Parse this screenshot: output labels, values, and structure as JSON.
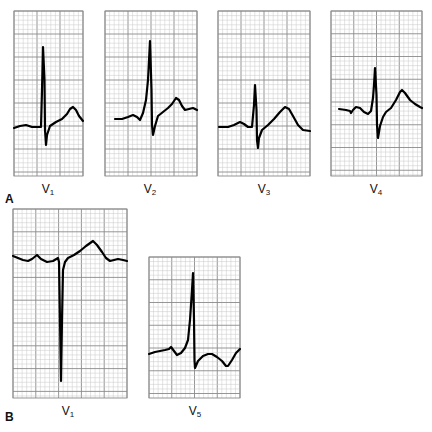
{
  "figure": {
    "panels": [
      {
        "id": "A",
        "letter": "A",
        "leads": [
          {
            "name": "V",
            "sub": "1",
            "box": [
              14,
              11,
              69,
              165
            ],
            "label_pos": [
              48,
              182
            ],
            "trace": [
              [
                14,
                128
              ],
              [
                20,
                126
              ],
              [
                26,
                125
              ],
              [
                32,
                127
              ],
              [
                41,
                127
              ],
              [
                42,
                90
              ],
              [
                43,
                47
              ],
              [
                44.5,
                80
              ],
              [
                45,
                130
              ],
              [
                46,
                145
              ],
              [
                47,
                135
              ],
              [
                50,
                126
              ],
              [
                56,
                122
              ],
              [
                62,
                119
              ],
              [
                67,
                114
              ],
              [
                70,
                109
              ],
              [
                73,
                107
              ],
              [
                76,
                110
              ],
              [
                79,
                116
              ],
              [
                83,
                121
              ]
            ]
          },
          {
            "name": "V",
            "sub": "2",
            "box": [
              105,
              11,
              92,
              165
            ],
            "label_pos": [
              150,
              182
            ],
            "trace": [
              [
                115,
                119
              ],
              [
                122,
                119
              ],
              [
                128,
                117
              ],
              [
                133,
                115
              ],
              [
                137,
                117
              ],
              [
                140,
                120
              ],
              [
                143,
                113
              ],
              [
                146,
                100
              ],
              [
                148,
                80
              ],
              [
                150,
                41
              ],
              [
                151.5,
                90
              ],
              [
                152,
                125
              ],
              [
                153,
                135
              ],
              [
                155,
                126
              ],
              [
                158,
                116
              ],
              [
                163,
                112
              ],
              [
                168,
                108
              ],
              [
                172,
                104
              ],
              [
                176,
                98
              ],
              [
                179,
                100
              ],
              [
                182,
                106
              ],
              [
                185,
                110
              ],
              [
                189,
                109
              ],
              [
                193,
                108
              ],
              [
                197,
                110
              ]
            ]
          },
          {
            "name": "V",
            "sub": "3",
            "box": [
              218,
              11,
              92,
              165
            ],
            "label_pos": [
              264,
              182
            ],
            "trace": [
              [
                219,
                127
              ],
              [
                228,
                127
              ],
              [
                234,
                125
              ],
              [
                240,
                122
              ],
              [
                244,
                124
              ],
              [
                248,
                127
              ],
              [
                252,
                127
              ],
              [
                254,
                105
              ],
              [
                255,
                85
              ],
              [
                256.5,
                110
              ],
              [
                257,
                140
              ],
              [
                258,
                148
              ],
              [
                259,
                138
              ],
              [
                262,
                130
              ],
              [
                268,
                125
              ],
              [
                274,
                119
              ],
              [
                280,
                112
              ],
              [
                285,
                107
              ],
              [
                289,
                109
              ],
              [
                293,
                116
              ],
              [
                298,
                125
              ],
              [
                303,
                130
              ],
              [
                310,
                131
              ]
            ]
          },
          {
            "name": "V",
            "sub": "4",
            "box": [
              331,
              11,
              91,
              165
            ],
            "label_pos": [
              376,
              182
            ],
            "trace": [
              [
                339,
                109
              ],
              [
                346,
                110
              ],
              [
                350,
                111
              ],
              [
                351,
                113
              ],
              [
                353,
                110
              ],
              [
                356,
                107
              ],
              [
                360,
                108
              ],
              [
                364,
                112
              ],
              [
                368,
                114
              ],
              [
                371,
                111
              ],
              [
                373,
                98
              ],
              [
                374,
                85
              ],
              [
                375,
                68
              ],
              [
                376.5,
                95
              ],
              [
                377,
                125
              ],
              [
                378,
                138
              ],
              [
                380,
                126
              ],
              [
                383,
                117
              ],
              [
                386,
                112
              ],
              [
                391,
                108
              ],
              [
                396,
                100
              ],
              [
                400,
                92
              ],
              [
                402,
                90
              ],
              [
                405,
                93
              ],
              [
                410,
                100
              ],
              [
                415,
                104
              ],
              [
                420,
                107
              ],
              [
                422,
                108
              ]
            ]
          }
        ]
      },
      {
        "id": "B",
        "letter": "B",
        "leads": [
          {
            "name": "V",
            "sub": "1",
            "box": [
              13,
              209,
              114,
              189
            ],
            "label_pos": [
              68,
              404
            ],
            "trace": [
              [
                13,
                256
              ],
              [
                18,
                258
              ],
              [
                23,
                260
              ],
              [
                28,
                261
              ],
              [
                32,
                259
              ],
              [
                37,
                255
              ],
              [
                41,
                259
              ],
              [
                47,
                262
              ],
              [
                53,
                261
              ],
              [
                58,
                258
              ],
              [
                59,
                262
              ],
              [
                60,
                320
              ],
              [
                61,
                381
              ],
              [
                62,
                320
              ],
              [
                63,
                270
              ],
              [
                65,
                262
              ],
              [
                68,
                258
              ],
              [
                74,
                255
              ],
              [
                80,
                251
              ],
              [
                86,
                246
              ],
              [
                93,
                241
              ],
              [
                97,
                245
              ],
              [
                102,
                252
              ],
              [
                106,
                258
              ],
              [
                110,
                261
              ],
              [
                114,
                260
              ],
              [
                118,
                259
              ],
              [
                123,
                260
              ],
              [
                127,
                261
              ]
            ]
          },
          {
            "name": "V",
            "sub": "5",
            "box": [
              149,
              257,
              91,
              141
            ],
            "label_pos": [
              195,
              404
            ],
            "trace": [
              [
                149,
                354
              ],
              [
                155,
                352
              ],
              [
                160,
                351
              ],
              [
                165,
                350
              ],
              [
                169,
                349
              ],
              [
                171,
                347
              ],
              [
                174,
                351
              ],
              [
                177,
                355
              ],
              [
                181,
                353
              ],
              [
                185,
                348
              ],
              [
                188,
                340
              ],
              [
                190,
                320
              ],
              [
                192,
                290
              ],
              [
                193,
                273
              ],
              [
                194,
                320
              ],
              [
                194.5,
                360
              ],
              [
                195,
                368
              ],
              [
                198,
                361
              ],
              [
                203,
                356
              ],
              [
                208,
                354
              ],
              [
                212,
                354
              ],
              [
                217,
                357
              ],
              [
                222,
                361
              ],
              [
                226,
                366
              ],
              [
                228,
                366
              ],
              [
                232,
                360
              ],
              [
                236,
                353
              ],
              [
                240,
                349
              ]
            ]
          }
        ]
      }
    ],
    "panel_letter_positions": {
      "A": [
        5,
        192
      ],
      "B": [
        5,
        410
      ]
    },
    "colors": {
      "grid_minor": "#c8c8c8",
      "grid_major": "#8a8a8a",
      "trace": "#000000",
      "background": "#ffffff"
    },
    "grid": {
      "minor_px": 4.6,
      "major_every": 5
    }
  }
}
